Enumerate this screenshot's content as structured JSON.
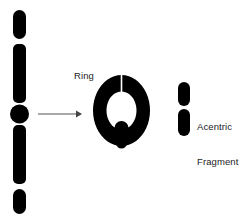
{
  "figure": {
    "background_color": "#ffffff",
    "stroke_color": "#000000",
    "arrow_color": "#555555",
    "text_color": "#1b1b1b"
  },
  "labels": {
    "ring": "Ring",
    "acentric_line1": "Acentric",
    "acentric_line2": "Fragment"
  },
  "elements": {
    "chromosome": {
      "name": "normal chromosome with centromere",
      "x": 13,
      "width": 13,
      "top": 10,
      "bottom": 214,
      "segments": [
        {
          "name": "short-arm-tip",
          "y1": 10,
          "y2": 39
        },
        {
          "name": "short-arm-body",
          "y1": 44,
          "y2": 103
        },
        {
          "name": "long-arm-body",
          "y1": 125,
          "y2": 184
        },
        {
          "name": "long-arm-tip",
          "y1": 189,
          "y2": 214
        }
      ],
      "centromere": {
        "cx": 19.5,
        "cy": 114,
        "r": 9.5
      }
    },
    "arrow": {
      "name": "transformation arrow",
      "x1": 38,
      "x2": 80,
      "y": 114
    },
    "ring": {
      "name": "ring chromosome",
      "cx": 121.5,
      "cy": 110.5,
      "outer_rx": 28.5,
      "outer_ry": 35.5,
      "inner_rx": 15,
      "inner_ry": 19,
      "gap_slit": {
        "x": 121.5,
        "y_top": 75,
        "y_bottom": 92
      },
      "centromere_notch": {
        "cx": 121.5,
        "cy": 128,
        "r": 6.5
      }
    },
    "acentric_fragment": {
      "name": "acentric fragment bar",
      "x": 178,
      "width": 12,
      "top": 82,
      "bottom": 136,
      "gap": {
        "y1": 106,
        "y2": 109
      }
    }
  }
}
